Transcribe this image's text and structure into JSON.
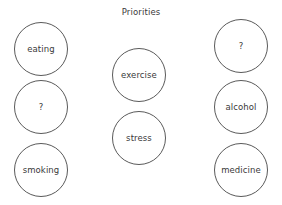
{
  "diagram": {
    "title": "Priorities",
    "background_color": "#ffffff",
    "stroke_color": "#5a5a5a",
    "text_color": "#3a3a3a",
    "node_shape": "circle",
    "node_diameter": 54,
    "columns": [
      {
        "name": "left-column",
        "center_x": 41,
        "nodes": [
          {
            "label": "eating",
            "center_y": 49
          },
          {
            "label": "?",
            "center_y": 107
          },
          {
            "label": "smoking",
            "center_y": 170
          }
        ]
      },
      {
        "name": "middle-column",
        "center_x": 139,
        "nodes": [
          {
            "label": "exercise",
            "center_y": 75
          },
          {
            "label": "stress",
            "center_y": 138
          }
        ]
      },
      {
        "name": "right-column",
        "center_x": 241,
        "nodes": [
          {
            "label": "?",
            "center_y": 46
          },
          {
            "label": "alcohol",
            "center_y": 107
          },
          {
            "label": "medicine",
            "center_y": 170
          }
        ]
      }
    ]
  }
}
